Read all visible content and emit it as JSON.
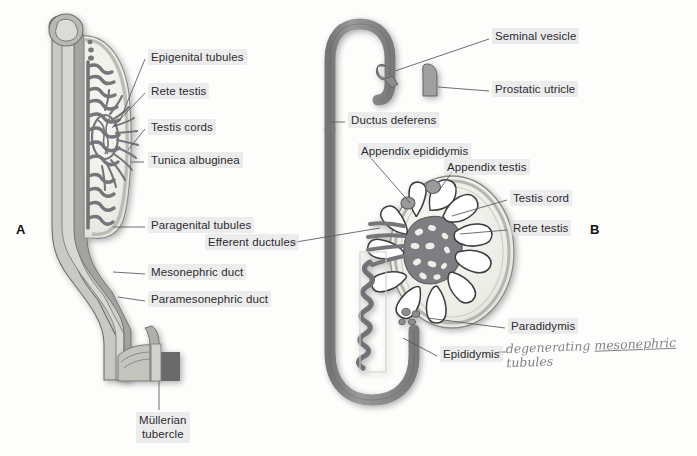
{
  "figure": {
    "background_color": "#fdfdfc",
    "duct_color": "#8a8a8a",
    "duct_outline_color": "#5f5f5f",
    "tubule_color": "#7c7c7c",
    "testis_fill": "#efefea",
    "tubercle_color": "#6a6a6a",
    "label_color": "#2b2b30",
    "leader_color": "#55555a"
  },
  "panels": [
    {
      "id": "A",
      "letter": "A",
      "x": 16,
      "y": 222
    },
    {
      "id": "B",
      "letter": "B",
      "x": 590,
      "y": 222
    }
  ],
  "labels": [
    {
      "name": "epigenital-tubules",
      "text": "Epigenital tubules",
      "panel": "A",
      "x": 148,
      "y": 49,
      "leader": [
        [
          145,
          59
        ],
        [
          120,
          120
        ]
      ]
    },
    {
      "name": "rete-testis-a",
      "text": "Rete testis",
      "panel": "A",
      "x": 148,
      "y": 83,
      "leader": [
        [
          145,
          93
        ],
        [
          112,
          128
        ]
      ]
    },
    {
      "name": "testis-cords",
      "text": "Testis cords",
      "panel": "A",
      "x": 148,
      "y": 119,
      "leader": [
        [
          145,
          129
        ],
        [
          128,
          150
        ]
      ]
    },
    {
      "name": "tunica-albuginea",
      "text": "Tunica albuginea",
      "panel": "A",
      "x": 148,
      "y": 152,
      "leader": [
        [
          144,
          162
        ],
        [
          131,
          162
        ]
      ]
    },
    {
      "name": "paragenital-tubules",
      "text": "Paragenital tubules",
      "panel": "A",
      "x": 148,
      "y": 217,
      "leader": [
        [
          145,
          227
        ],
        [
          113,
          227
        ]
      ]
    },
    {
      "name": "mesonephric-duct",
      "text": "Mesonephric duct",
      "panel": "A",
      "x": 148,
      "y": 264,
      "leader": [
        [
          145,
          274
        ],
        [
          113,
          272
        ]
      ]
    },
    {
      "name": "paramesonephric-duct",
      "text": "Paramesonephric duct",
      "panel": "A",
      "x": 148,
      "y": 291,
      "leader": [
        [
          145,
          301
        ],
        [
          118,
          297
        ]
      ]
    },
    {
      "name": "mullerian-tubercle",
      "text": "Müllerian\ntubercle",
      "panel": "A",
      "x": 136,
      "y": 412,
      "leader": [
        [
          159,
          410
        ],
        [
          159,
          381
        ]
      ]
    },
    {
      "name": "seminal-vesicle",
      "text": "Seminal vesicle",
      "panel": "B",
      "x": 492,
      "y": 28,
      "leader": [
        [
          489,
          39
        ],
        [
          395,
          71
        ]
      ]
    },
    {
      "name": "prostatic-utricle",
      "text": "Prostatic utricle",
      "panel": "B",
      "x": 492,
      "y": 81,
      "leader": [
        [
          489,
          91
        ],
        [
          438,
          87
        ]
      ]
    },
    {
      "name": "ductus-deferens",
      "text": "Ductus deferens",
      "panel": "B",
      "x": 348,
      "y": 112,
      "leader": [
        [
          345,
          122
        ],
        [
          331,
          122
        ]
      ]
    },
    {
      "name": "appendix-epididymis",
      "text": "Appendix epididymis",
      "panel": "B",
      "x": 358,
      "y": 143,
      "leader": [
        [
          370,
          157
        ],
        [
          410,
          203
        ]
      ]
    },
    {
      "name": "appendix-testis",
      "text": "Appendix testis",
      "panel": "B",
      "x": 444,
      "y": 159,
      "leader": [
        [
          452,
          172
        ],
        [
          438,
          192
        ]
      ]
    },
    {
      "name": "testis-cord-b",
      "text": "Testis cord",
      "panel": "B",
      "x": 510,
      "y": 190,
      "leader": [
        [
          507,
          200
        ],
        [
          452,
          216
        ]
      ]
    },
    {
      "name": "rete-testis-b",
      "text": "Rete testis",
      "panel": "B",
      "x": 510,
      "y": 220,
      "leader": [
        [
          507,
          230
        ],
        [
          460,
          234
        ]
      ]
    },
    {
      "name": "efferent-ductules",
      "text": "Efferent ductules",
      "panel": "B",
      "x": 205,
      "y": 234,
      "leader": [
        [
          290,
          243
        ],
        [
          380,
          228
        ]
      ]
    },
    {
      "name": "paradidymis",
      "text": "Paradidymis",
      "panel": "B",
      "x": 508,
      "y": 318,
      "leader": [
        [
          505,
          328
        ],
        [
          428,
          318
        ]
      ]
    },
    {
      "name": "epididymis",
      "text": "Epididymis",
      "panel": "B",
      "x": 440,
      "y": 346,
      "leader": [
        [
          437,
          356
        ],
        [
          403,
          338
        ]
      ]
    }
  ],
  "annotation": {
    "name": "handwritten-note",
    "line1": "degenerating",
    "line2_underlined": "mesonephric",
    "line3": "tubules",
    "full_text": "degenerating mesonephric tubules",
    "x": 506,
    "y": 339,
    "color": "#6d6d70"
  }
}
